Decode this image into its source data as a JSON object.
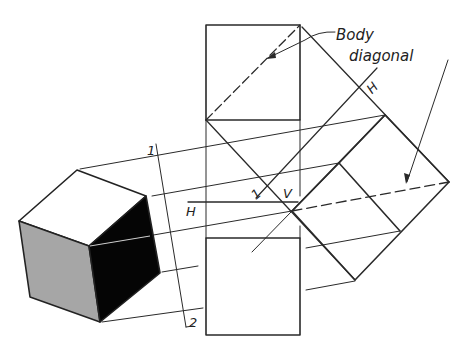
{
  "figure": {
    "colors": {
      "ink": "#2a2a2a",
      "paper": "#ffffff",
      "gray_face": "#a6a6a6",
      "black_face": "#050505"
    }
  },
  "labels": {
    "callout_line1": "Body",
    "callout_line2": "diagonal",
    "ref_line_1": "1",
    "ref_line_2": "2",
    "fold_H_left": "H",
    "fold_V": "V",
    "fold_1": "1",
    "fold_H_right": "H"
  },
  "views": {
    "pictorial_cube": {
      "shaded_faces": [
        "gray",
        "black"
      ]
    },
    "front_view": {
      "shape": "square",
      "diagonal": "dashed"
    },
    "top_view": {
      "shape": "square"
    },
    "auxiliary_view": {
      "shape": "rotated square",
      "diagonal": "dashed"
    }
  }
}
